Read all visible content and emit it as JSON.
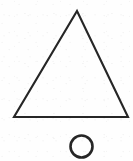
{
  "figure": {
    "background_color": "#fefefe",
    "ink_color": "#262626",
    "canvas": {
      "width": 133,
      "height": 161
    },
    "shapes": [
      {
        "name": "triangle",
        "type": "polygon",
        "fill": "none",
        "stroke_color": "#262626",
        "stroke_width": 2.1,
        "points": "77,11 128,117 14,117",
        "apex": {
          "x": 77,
          "y": 11
        },
        "bottom_left": {
          "x": 14,
          "y": 117
        },
        "bottom_right": {
          "x": 128,
          "y": 117
        },
        "base_width": 114,
        "height": 106
      },
      {
        "name": "circle",
        "type": "circle",
        "fill": "none",
        "stroke_color": "#262626",
        "stroke_width": 2.6,
        "center": {
          "x": 81.5,
          "y": 146.5
        },
        "radius": 11,
        "diameter": 22
      }
    ]
  }
}
